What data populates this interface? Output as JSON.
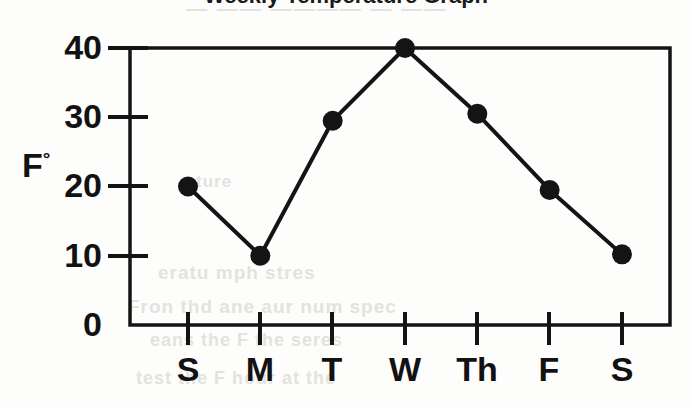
{
  "chart_data": {
    "type": "line",
    "title": "Weekly Temperature Graph",
    "xlabel": "",
    "ylabel": "F°",
    "categories": [
      "S",
      "M",
      "T",
      "W",
      "Th",
      "F",
      "S"
    ],
    "values": [
      20,
      10,
      29.5,
      40,
      30.5,
      19.5,
      10.2
    ],
    "series": [
      {
        "name": "Temperature",
        "values": [
          20,
          10,
          29.5,
          40,
          30.5,
          19.5,
          10.2
        ]
      }
    ],
    "ylim": [
      0,
      40
    ],
    "yticks": [
      0,
      10,
      20,
      30,
      40
    ],
    "ytick_labels": [
      "0",
      "10",
      "20",
      "30",
      "40"
    ],
    "xtick_labels": [
      "S",
      "M",
      "T",
      "W",
      "Th",
      "F",
      "S"
    ],
    "grid": false,
    "legend": "none",
    "marker": "filled-circle",
    "line_color": "#111111",
    "marker_color": "#111111",
    "axis_color": "#111111",
    "background_color": "#fdfdfc"
  },
  "axes": {
    "y_unit_letter": "F",
    "y_unit_degree": "°"
  },
  "background_bleed": {
    "line_1": "— —— ———— — ——",
    "line_2": "ture",
    "line_3": "eratu  mph  stres",
    "line_4": "Fron  thd ane  aur num  spec",
    "line_5": "eans  the  F  the  seres",
    "line_6": "test  the  F  hour  at  the"
  }
}
